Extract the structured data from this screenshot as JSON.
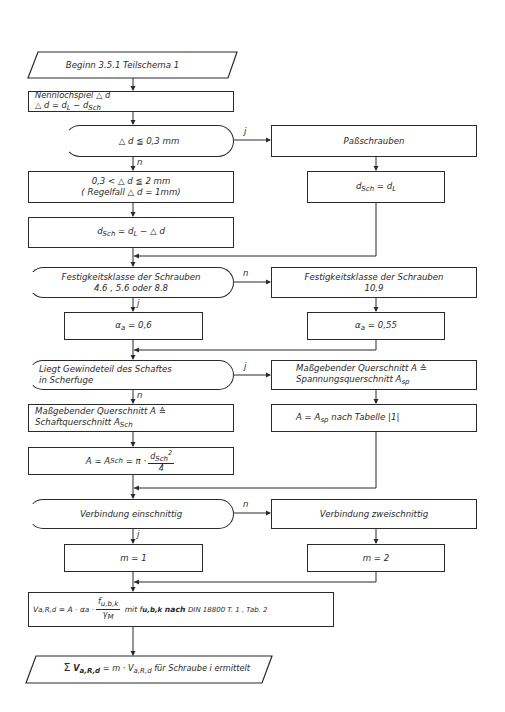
{
  "title": "Beginn 3.5.1 Teilschema 1",
  "branch_labels": {
    "yes": "j",
    "no": "n"
  },
  "nodes": {
    "start": {
      "text": "Beginn 3.5.1 Teilschema 1"
    },
    "nennlochspiel": {
      "line1": "Nennlochspiel △ d",
      "line2_a": "△ d = d",
      "line2_sub1": "L",
      "line2_b": " − d",
      "line2_sub2": "Sch"
    },
    "decision_clearance": {
      "text": "△ d ≦ 0,3 mm"
    },
    "passchrauben": {
      "text": "Paßschrauben"
    },
    "dsch_eq_dl": {
      "a": "d",
      "sub1": "Sch",
      "b": " = d",
      "sub2": "L"
    },
    "range": {
      "line1": "0,3 < △ d ≦ 2 mm",
      "line2": "( Regelfall △ d = 1mm)"
    },
    "dsch_calc": {
      "a": "d",
      "sub1": "Sch",
      "b": " = d",
      "sub2": "L",
      "c": " − △ d"
    },
    "decision_strength": {
      "line1": "Festigkeitsklasse der Schrauben",
      "line2": "4.6 , 5.6 oder 8.8"
    },
    "strength_109": {
      "line1": "Festigkeitsklasse der Schrauben",
      "line2": "10,9"
    },
    "alpha_06": {
      "a": "α",
      "sub": "a",
      "b": " = 0,6"
    },
    "alpha_055": {
      "a": "α",
      "sub": "a",
      "b": " = 0,55"
    },
    "decision_thread": {
      "line1": "Liegt Gewindeteil des Schaftes",
      "line2": "in Scherfuge"
    },
    "stress_section": {
      "line1": "Maßgebender Querschnitt A ≙",
      "line2_a": "Spannungsquerschnitt A",
      "line2_sub": "sp"
    },
    "shaft_section": {
      "line1": "Maßgebender Querschnitt A ≙",
      "line2_a": "Schaftquerschnitt A",
      "line2_sub": "Sch"
    },
    "a_asp": {
      "a": "A = A",
      "sub": "sp",
      "b": "  nach Tabelle |1|"
    },
    "a_asch": {
      "a": "A = A",
      "sub": "Sch",
      "b": " = π ·",
      "frac_num": "d",
      "frac_num_sub": "Sch",
      "frac_num_sup": "2",
      "frac_den": "4"
    },
    "decision_single_shear": {
      "text": "Verbindung einschnittig"
    },
    "double_shear": {
      "text": "Verbindung zweischnittig"
    },
    "m1": {
      "text": "m = 1"
    },
    "m2": {
      "text": "m = 2"
    },
    "formula_v": {
      "a": "V",
      "a_sub": "a,R,d",
      "b": " = A · α",
      "b_sub": "a",
      "c": " ·",
      "frac_num": "f",
      "frac_num_sub": "u,b,k",
      "frac_den": "γ",
      "frac_den_sub": "M",
      "d": " mit f",
      "d_sub": "u,b,k",
      "e": " nach ",
      "f": "DIN 18800 T. 1 , Tab. 2"
    },
    "end": {
      "sigma": "Σ",
      "v": "V",
      "v_sub": "a,R,d",
      "eq": " = m · V",
      "eq_sub": "a,R,d",
      "rest": " für Schraube i ermittelt"
    }
  }
}
